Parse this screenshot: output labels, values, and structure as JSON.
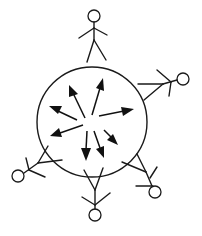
{
  "diagram": {
    "title": "",
    "circle": {
      "cx": 92,
      "cy": 122,
      "r": 55
    },
    "figures_count": 5,
    "arrows_count": 8,
    "colors": {
      "stroke": "#1a1a1a",
      "background": "#ffffff"
    }
  }
}
